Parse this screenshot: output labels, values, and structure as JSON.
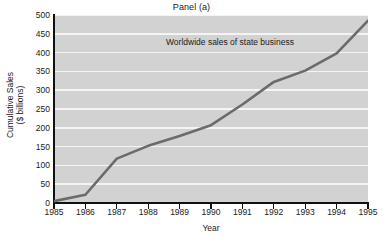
{
  "chart_data": {
    "type": "line",
    "title": "Panel (a)",
    "xlabel": "Year",
    "ylabel": "Cumulative Sales\n($ billions)",
    "ylabel_lines": [
      "Cumulative Sales",
      "($ billions)"
    ],
    "annotations": [
      "Worldwide sales of state business"
    ],
    "grid": "horizontal",
    "legend": "none",
    "xlim": [
      1985,
      1995
    ],
    "ylim": [
      0,
      500
    ],
    "ytick_step": 50,
    "categories": [
      1985,
      1986,
      1987,
      1988,
      1989,
      1990,
      1991,
      1992,
      1993,
      1994,
      1995
    ],
    "x": [
      1985,
      1986,
      1987,
      1988,
      1989,
      1990,
      1991,
      1992,
      1993,
      1994,
      1995
    ],
    "xticklabels": [
      "1985",
      "1986",
      "1987",
      "1988",
      "1989",
      "1990",
      "1991",
      "1992",
      "1993",
      "1994",
      "1995"
    ],
    "yticklabels": [
      "0",
      "50",
      "100",
      "150",
      "200",
      "250",
      "300",
      "350",
      "400",
      "450",
      "500"
    ],
    "yticks": [
      0,
      50,
      100,
      150,
      200,
      250,
      300,
      350,
      400,
      450,
      500
    ],
    "series": [
      {
        "name": "Worldwide sales of state business",
        "values": [
          5,
          22,
          118,
          152,
          178,
          207,
          262,
          322,
          352,
          398,
          485
        ],
        "color": "#6b6b6b",
        "linewidth": 2.6
      }
    ],
    "colors": {
      "plot_background": "#d2d2d2",
      "gridline": "#f4f4f4",
      "axis": "#111111",
      "line": "#6b6b6b",
      "text": "#1a1a1a",
      "figure_background": "#ffffff"
    }
  }
}
